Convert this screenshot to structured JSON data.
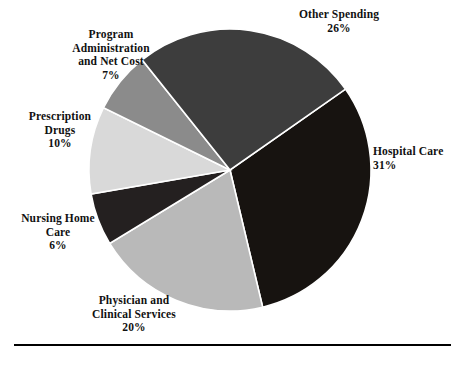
{
  "figure": {
    "name": "national-health-expenditure-pie",
    "background_color": "#ffffff",
    "rule_color": "#000000"
  },
  "chart_data": {
    "type": "pie",
    "title": "",
    "subtitle": "",
    "xlabel": "",
    "ylabel": "",
    "legend_position": "none",
    "grid": false,
    "units": "percent",
    "total": 100,
    "start_angle_deg": 55,
    "direction": "clockwise",
    "categories": [
      "Hospital Care",
      "Physician and Clinical Services",
      "Nursing Home Care",
      "Prescription Drugs",
      "Program Administration and Net Cost",
      "Other Spending"
    ],
    "values": [
      31,
      20,
      6,
      10,
      7,
      26
    ],
    "colors": [
      "#171310",
      "#b9b9b9",
      "#242020",
      "#d9d9d9",
      "#8b8b8b",
      "#3d3d3d"
    ],
    "slices": [
      {
        "label": "Hospital Care",
        "label_lines": [
          "Hospital Care"
        ],
        "value": 31,
        "percent_text": "31%",
        "color": "#171310"
      },
      {
        "label": "Physician and Clinical Services",
        "label_lines": [
          "Physician and",
          "Clinical Services"
        ],
        "value": 20,
        "percent_text": "20%",
        "color": "#b9b9b9"
      },
      {
        "label": "Nursing Home Care",
        "label_lines": [
          "Nursing Home",
          "Care"
        ],
        "value": 6,
        "percent_text": "6%",
        "color": "#242020"
      },
      {
        "label": "Prescription Drugs",
        "label_lines": [
          "Prescription",
          "Drugs"
        ],
        "value": 10,
        "percent_text": "10%",
        "color": "#d9d9d9"
      },
      {
        "label": "Program Administration and Net Cost",
        "label_lines": [
          "Program",
          "Administration",
          "and Net Cost"
        ],
        "value": 7,
        "percent_text": "7%",
        "color": "#8b8b8b"
      },
      {
        "label": "Other Spending",
        "label_lines": [
          "Other Spending"
        ],
        "value": 26,
        "percent_text": "26%",
        "color": "#3d3d3d"
      }
    ]
  },
  "labels": {
    "other_spending": "Other Spending\n26%",
    "hospital_care": "Hospital Care\n31%",
    "physician_clinical": "Physician and\nClinical Services\n20%",
    "nursing_home": "Nursing Home\nCare\n6%",
    "prescription_drugs": "Prescription\nDrugs\n10%",
    "program_admin": "Program\nAdministration\nand Net Cost\n7%"
  }
}
